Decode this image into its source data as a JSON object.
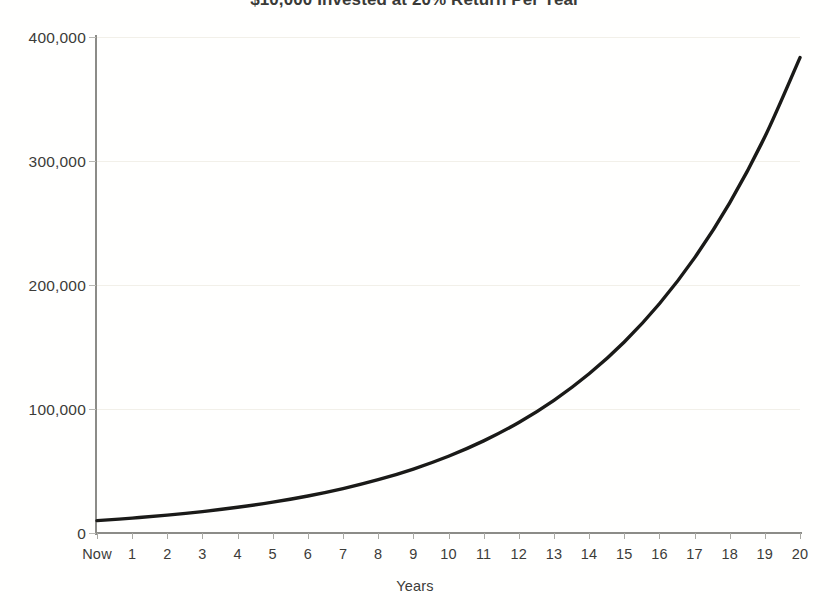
{
  "chart_data": {
    "type": "line",
    "title": "$10,000 Invested at 20% Return Per Year",
    "xlabel": "Years",
    "ylabel": "",
    "grid": true,
    "legend": "none",
    "xlim": [
      0,
      20
    ],
    "ylim": [
      0,
      400000
    ],
    "y_ticks": [
      0,
      100000,
      200000,
      300000,
      400000
    ],
    "y_tick_labels": [
      "0",
      "100,000",
      "200,000",
      "300,000",
      "400,000"
    ],
    "categories": [
      "Now",
      "1",
      "2",
      "3",
      "4",
      "5",
      "6",
      "7",
      "8",
      "9",
      "10",
      "11",
      "12",
      "13",
      "14",
      "15",
      "16",
      "17",
      "18",
      "19",
      "20"
    ],
    "x": [
      0,
      1,
      2,
      3,
      4,
      5,
      6,
      7,
      8,
      9,
      10,
      11,
      12,
      13,
      14,
      15,
      16,
      17,
      18,
      19,
      20
    ],
    "series": [
      {
        "name": "Portfolio Value",
        "color": "#1a1a18",
        "values": [
          10000,
          12000,
          14400,
          17280,
          20736,
          24883,
          29860,
          35832,
          42998,
          51598,
          61917,
          74301,
          89161,
          106993,
          128392,
          154070,
          184884,
          221861,
          266233,
          319480,
          383376
        ]
      }
    ]
  },
  "chart": {
    "title": "$10,000 Invested at 20% Return Per Year",
    "x_axis_title": "Years",
    "y_labels": [
      "400,000",
      "300,000",
      "200,000",
      "100,000",
      "0"
    ],
    "x_labels": [
      "Now",
      "1",
      "2",
      "3",
      "4",
      "5",
      "6",
      "7",
      "8",
      "9",
      "10",
      "11",
      "12",
      "13",
      "14",
      "15",
      "16",
      "17",
      "18",
      "19",
      "20"
    ],
    "colors": {
      "line": "#1a1a18",
      "axis": "#8c8c88",
      "grid": "#f2f0e9",
      "text": "#3c3c39",
      "background": "#fffffe"
    }
  }
}
